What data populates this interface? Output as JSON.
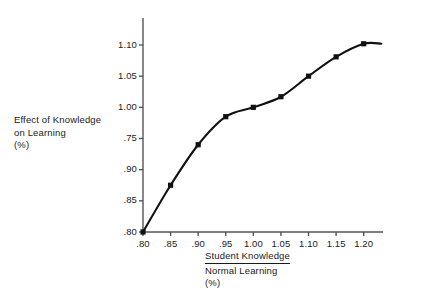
{
  "chart_data": {
    "type": "line",
    "title": "",
    "subtitle": "",
    "xlabel_numerator": "Student Knowledge",
    "xlabel_denominator": "Normal Learning",
    "xlabel_unit": "(%)",
    "ylabel_lines": "Effect of Knowledge\non Learning\n(%)",
    "ylabel_line1": "Effect of Knowledge",
    "ylabel_line2": "on Learning",
    "ylabel_line3": "(%)",
    "x": [
      0.8,
      0.85,
      0.9,
      0.95,
      1.0,
      1.05,
      1.1,
      1.15,
      1.2
    ],
    "values": [
      0.8,
      0.875,
      0.94,
      0.985,
      1.0,
      1.017,
      1.05,
      1.081,
      1.102
    ],
    "series": [
      {
        "name": "Effect of Knowledge on Learning",
        "values": [
          0.8,
          0.875,
          0.94,
          0.985,
          1.0,
          1.017,
          1.05,
          1.081,
          1.102
        ]
      }
    ],
    "xticks": [
      ".80",
      ".85",
      ".90",
      ".95",
      "1.00",
      "1.05",
      "1.10",
      "1.15",
      "1.20"
    ],
    "xtick_values": [
      0.8,
      0.85,
      0.9,
      0.95,
      1.0,
      1.05,
      1.1,
      1.15,
      1.2
    ],
    "yticks": [
      ".80",
      ".85",
      ".90",
      ".75",
      "1.00",
      "1.05",
      "1.10"
    ],
    "ytick_values": [
      0.8,
      0.85,
      0.9,
      0.95,
      1.0,
      1.05,
      1.1
    ],
    "xlim": [
      0.8,
      1.235
    ],
    "ylim": [
      0.8,
      1.138
    ],
    "grid": false,
    "legend": "none",
    "line_color": "#111111",
    "marker_color": "#111111",
    "axis_color": "#555555",
    "background": "#ffffff",
    "tail_extends_past_last_point": true,
    "tail_end_x": 1.232
  }
}
